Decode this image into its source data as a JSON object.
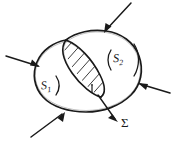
{
  "figure": {
    "type": "hand-drawn-diagram",
    "background_color": "#ffffff",
    "ink_color": "#1a1a1a",
    "labels": {
      "surface_1": "S",
      "surface_1_subscript": "1",
      "surface_2": "S",
      "surface_2_subscript": "2",
      "intersection": "Σ"
    },
    "regions": [
      {
        "name": "outer-ellipse",
        "description": "large tilted ellipse enclosing both surfaces",
        "filled": false
      },
      {
        "name": "lens-intersection",
        "description": "hatched lens-shaped overlap region between S1 and S2",
        "filled": "diagonal-hatching",
        "label": "Σ"
      }
    ],
    "arrows": [
      {
        "name": "arrow-left",
        "direction": "right",
        "from": [
          6,
          56
        ],
        "to": [
          40,
          66
        ]
      },
      {
        "name": "arrow-top",
        "direction": "down-left",
        "from": [
          131,
          3
        ],
        "to": [
          104,
          33
        ]
      },
      {
        "name": "arrow-right",
        "direction": "left",
        "from": [
          170,
          93
        ],
        "to": [
          138,
          83
        ]
      },
      {
        "name": "arrow-bottom-left",
        "direction": "up-right",
        "from": [
          31,
          137
        ],
        "to": [
          65,
          112
        ]
      },
      {
        "name": "arrow-sigma",
        "direction": "down-right",
        "from": [
          100,
          97
        ],
        "to": [
          118,
          122
        ]
      }
    ]
  }
}
